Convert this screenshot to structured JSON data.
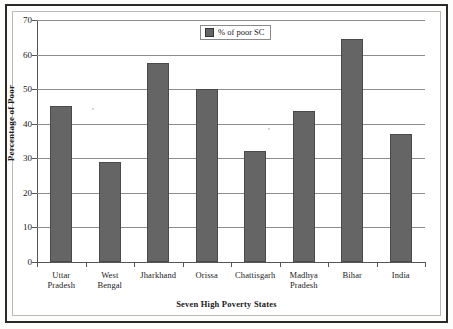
{
  "chart_data": {
    "type": "bar",
    "title": "",
    "xlabel": "Seven High Poverty States",
    "ylabel": "Percentage of Poor",
    "categories": [
      "Uttar Pradesh",
      "West Bengal",
      "Jharkhand",
      "Orissa",
      "Chattisgarh",
      "Madhya Pradesh",
      "Bihar",
      "India"
    ],
    "category_lines": [
      [
        "Uttar",
        "Pradesh"
      ],
      [
        "West",
        "Bengal"
      ],
      [
        "Jharkhand",
        ""
      ],
      [
        "Orissa",
        ""
      ],
      [
        "Chattisgarh",
        ""
      ],
      [
        "Madhya",
        "Pradesh"
      ],
      [
        "Bihar",
        ""
      ],
      [
        "India",
        ""
      ]
    ],
    "series": [
      {
        "name": "% of poor SC",
        "values": [
          45,
          29,
          57.5,
          50,
          32.2,
          43.8,
          64.5,
          37
        ]
      }
    ],
    "values": [
      45,
      29,
      57.5,
      50,
      32.2,
      43.8,
      64.5,
      37
    ],
    "ylim": [
      0,
      70
    ],
    "ytick_labels": [
      "70",
      "60",
      "50",
      "40",
      "30",
      "20",
      "10",
      "0"
    ],
    "ytick_values": [
      70,
      60,
      50,
      40,
      30,
      20,
      10,
      0
    ],
    "grid": true,
    "legend_position": "top-center",
    "legend_entries": [
      "% of poor SC"
    ],
    "bar_color": "#656565",
    "grid_color": "#8d8d8d",
    "axis_color": "#555555"
  },
  "legend": {
    "label": "% of poor SC"
  }
}
